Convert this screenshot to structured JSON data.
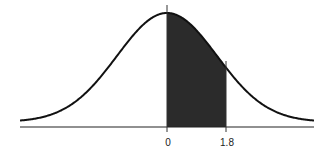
{
  "chart_data": {
    "type": "area",
    "title": "",
    "xlabel": "",
    "ylabel": "",
    "distribution": "standard normal",
    "shaded_region": {
      "from": 0,
      "to": 1.8
    },
    "tick_labels": [
      "0",
      "1.8"
    ],
    "grid": false,
    "legend": null,
    "colors": {
      "curve": "#111111",
      "shade": "#2b2b2b",
      "axis": "#222222"
    }
  },
  "labels": {
    "zero": "0",
    "upper": "1.8"
  }
}
